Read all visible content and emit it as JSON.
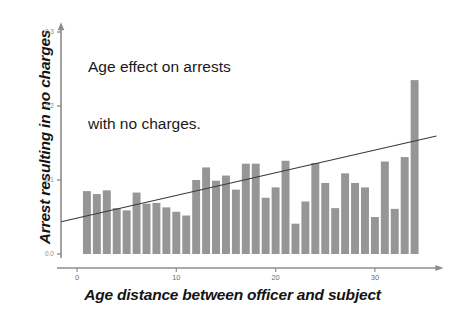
{
  "chart_data": {
    "type": "bar",
    "title": "Age effect on arrests with no charges.",
    "title_lines": [
      "Age effect on arrests",
      "with no charges."
    ],
    "xlabel": "Age distance between officer and subject",
    "ylabel": "Arrest resulting in no charges",
    "xlim": [
      -1.8,
      36.5
    ],
    "ylim": [
      0.0,
      0.305
    ],
    "grid": false,
    "legend": null,
    "bar_color": "#969696",
    "trend_color": "#3a3a3a",
    "axis_color": "#8c8c8c",
    "yticks": [
      0.0,
      0.1,
      0.2,
      0.3
    ],
    "ytick_labels": [
      "0.0",
      "0.1",
      "0.2",
      "0.3"
    ],
    "xticks": [
      0,
      10,
      20,
      30
    ],
    "xtick_labels": [
      "0",
      "10",
      "20",
      "30"
    ],
    "categories": [
      1,
      2,
      3,
      4,
      5,
      6,
      7,
      8,
      9,
      10,
      11,
      12,
      13,
      14,
      15,
      16,
      17,
      18,
      19,
      20,
      21,
      22,
      23,
      24,
      25,
      26,
      27,
      28,
      29,
      30,
      31,
      32,
      33,
      34
    ],
    "values": [
      0.085,
      0.081,
      0.086,
      0.062,
      0.059,
      0.083,
      0.068,
      0.069,
      0.063,
      0.057,
      0.052,
      0.1,
      0.117,
      0.099,
      0.106,
      0.087,
      0.122,
      0.122,
      0.076,
      0.09,
      0.126,
      0.041,
      0.071,
      0.123,
      0.096,
      0.062,
      0.109,
      0.096,
      0.09,
      0.05,
      0.125,
      0.061,
      0.131,
      0.235
    ],
    "series": [
      {
        "name": "Arrest resulting in no charges",
        "values": [
          0.085,
          0.081,
          0.086,
          0.062,
          0.059,
          0.083,
          0.068,
          0.069,
          0.063,
          0.057,
          0.052,
          0.1,
          0.117,
          0.099,
          0.106,
          0.087,
          0.122,
          0.122,
          0.076,
          0.09,
          0.126,
          0.041,
          0.071,
          0.123,
          0.096,
          0.062,
          0.109,
          0.096,
          0.09,
          0.05,
          0.125,
          0.061,
          0.131,
          0.235
        ]
      }
    ],
    "trendline": {
      "type": "line",
      "x": [
        -1.6,
        36.2
      ],
      "y": [
        0.0435,
        0.1595
      ]
    }
  }
}
